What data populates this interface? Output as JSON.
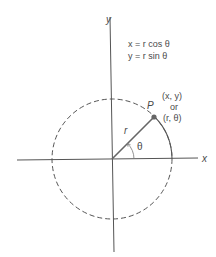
{
  "diagram": {
    "axes": {
      "x_label": "x",
      "y_label": "y"
    },
    "equations": {
      "line1": "x = r cos θ",
      "line2": "y = r sin θ"
    },
    "point": {
      "name": "P",
      "cartesian": "(x, y)",
      "connector": "or",
      "polar": "(r, θ)"
    },
    "radius_label": "r",
    "angle_label": "θ",
    "colors": {
      "lines": "#555555",
      "text": "#4a4a4a",
      "point": "#666666"
    }
  }
}
